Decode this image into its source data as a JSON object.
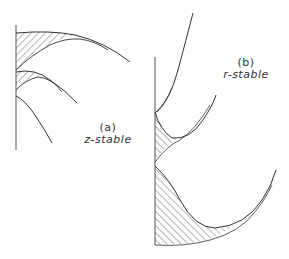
{
  "figure": {
    "panels": [
      {
        "id": "a",
        "tag": "(a)",
        "caption": "z-stable"
      },
      {
        "id": "b",
        "tag": "(b)",
        "caption": "r-stable"
      }
    ]
  },
  "colors": {
    "ink": "#333333",
    "background": "#ffffff"
  }
}
